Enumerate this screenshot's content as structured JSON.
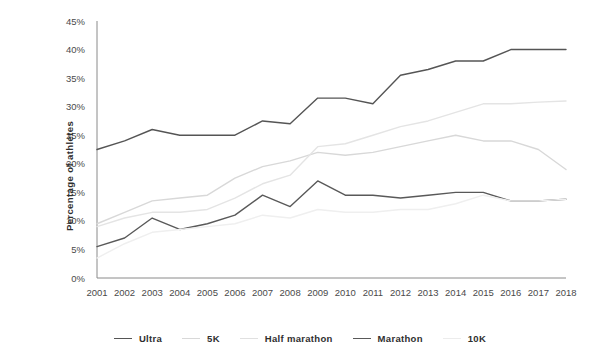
{
  "chart_data": {
    "type": "line",
    "title": "",
    "xlabel": "",
    "ylabel": "Percentage of athletes",
    "xlim": [
      2001,
      2018
    ],
    "ylim": [
      0,
      45
    ],
    "ytick_step": 5,
    "grid": false,
    "legend_position": "bottom",
    "x": [
      2001,
      2002,
      2003,
      2004,
      2005,
      2006,
      2007,
      2008,
      2009,
      2010,
      2011,
      2012,
      2013,
      2014,
      2015,
      2016,
      2017,
      2018
    ],
    "categories": [
      "2001",
      "2002",
      "2003",
      "2004",
      "2005",
      "2006",
      "2007",
      "2008",
      "2009",
      "2010",
      "2011",
      "2012",
      "2013",
      "2014",
      "2015",
      "2016",
      "2017",
      "2018"
    ],
    "ytick_labels": [
      "0%",
      "5%",
      "10%",
      "15%",
      "20%",
      "25%",
      "30%",
      "35%",
      "40%",
      "45%"
    ],
    "ytick_values": [
      0,
      5,
      10,
      15,
      20,
      25,
      30,
      35,
      40,
      45
    ],
    "series": [
      {
        "name": "Ultra",
        "color": "#555555",
        "width": 1.5,
        "values": [
          22.5,
          24.0,
          26.0,
          25.0,
          25.0,
          25.0,
          27.5,
          27.0,
          31.5,
          31.5,
          30.5,
          35.5,
          36.5,
          38.0,
          38.0,
          40.0,
          40.0,
          40.0
        ]
      },
      {
        "name": "5K",
        "color": "#d8d8d8",
        "width": 1.4,
        "values": [
          9.5,
          11.5,
          13.5,
          14.0,
          14.5,
          17.5,
          19.5,
          20.5,
          22.0,
          21.5,
          22.0,
          23.0,
          24.0,
          25.0,
          24.0,
          24.0,
          22.5,
          19.0
        ]
      },
      {
        "name": "Half marathon",
        "color": "#e4e4e4",
        "width": 1.4,
        "values": [
          9.0,
          10.5,
          11.5,
          11.5,
          12.0,
          14.0,
          16.5,
          18.0,
          23.0,
          23.5,
          25.0,
          26.5,
          27.5,
          29.0,
          30.5,
          30.5,
          30.8,
          31.0
        ]
      },
      {
        "name": "Marathon",
        "color": "#595959",
        "width": 1.5,
        "values": [
          5.5,
          7.0,
          10.5,
          8.5,
          9.5,
          11.0,
          14.5,
          12.5,
          17.0,
          14.5,
          14.5,
          14.0,
          14.5,
          15.0,
          15.0,
          13.5,
          13.5,
          13.8
        ]
      },
      {
        "name": "10K",
        "color": "#efefef",
        "width": 1.4,
        "values": [
          3.5,
          6.0,
          8.0,
          8.5,
          9.0,
          9.5,
          11.0,
          10.5,
          12.0,
          11.5,
          11.5,
          12.0,
          12.0,
          13.0,
          14.5,
          13.5,
          13.5,
          13.8
        ]
      }
    ]
  },
  "legend": {
    "items": [
      {
        "label": "Ultra",
        "color": "#555555"
      },
      {
        "label": "5K",
        "color": "#d8d8d8"
      },
      {
        "label": "Half marathon",
        "color": "#e0e0e0"
      },
      {
        "label": "Marathon",
        "color": "#595959"
      },
      {
        "label": "10K",
        "color": "#ececec"
      }
    ]
  }
}
